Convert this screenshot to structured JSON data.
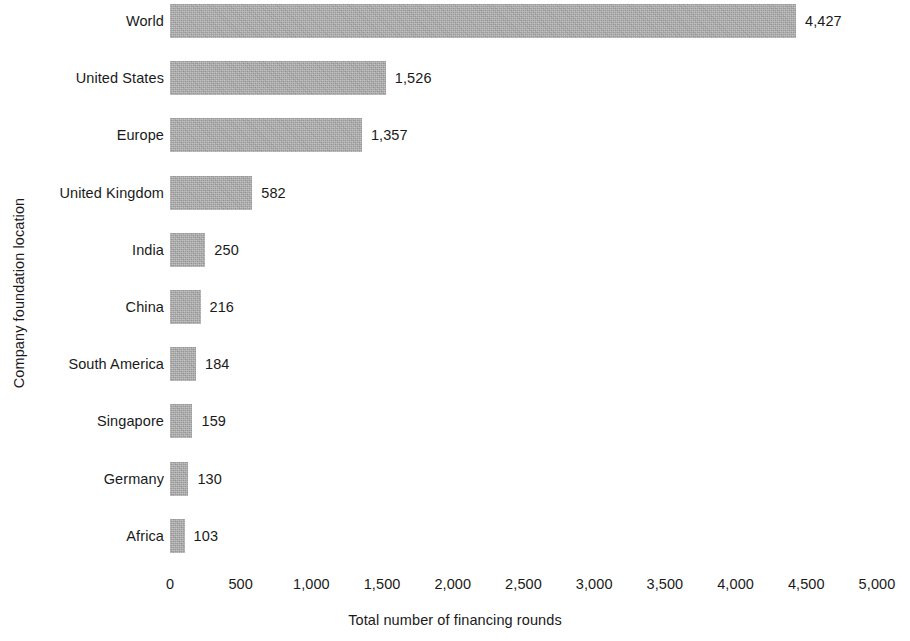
{
  "chart_data": {
    "type": "bar",
    "orientation": "horizontal",
    "title": "",
    "subtitle": "",
    "xlabel": "Total number of financing rounds",
    "ylabel": "Company foundation location",
    "xlim": [
      0,
      5000
    ],
    "x_tick_labels": [
      "0",
      "500",
      "1,000",
      "1,500",
      "2,000",
      "2,500",
      "3,000",
      "3,500",
      "4,000",
      "4,500",
      "5,000"
    ],
    "x_tick_values": [
      0,
      500,
      1000,
      1500,
      2000,
      2500,
      3000,
      3500,
      4000,
      4500,
      5000
    ],
    "grid": false,
    "legend": null,
    "bar_color": "#a8a8a8",
    "categories": [
      "World",
      "United States",
      "Europe",
      "United Kingdom",
      "India",
      "China",
      "South America",
      "Singapore",
      "Germany",
      "Africa"
    ],
    "values": [
      4427,
      1526,
      1357,
      582,
      250,
      216,
      184,
      159,
      130,
      103
    ],
    "value_labels": [
      "4,427",
      "1,526",
      "1,357",
      "582",
      "250",
      "216",
      "184",
      "159",
      "130",
      "103"
    ]
  }
}
